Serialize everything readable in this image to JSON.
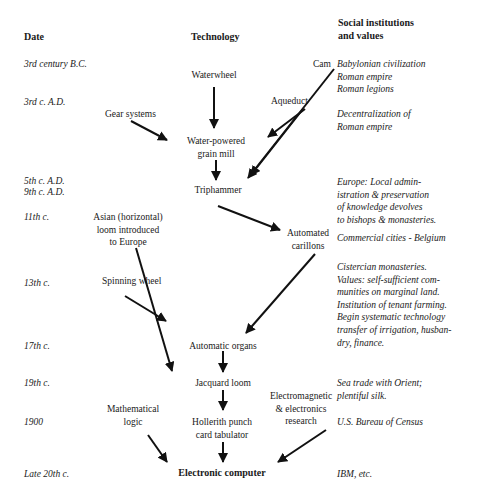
{
  "headers": {
    "date": "Date",
    "technology": "Technology",
    "social": [
      "Social institutions",
      "and values"
    ]
  },
  "dates": [
    "3rd century B.C.",
    "3rd c. A.D.",
    "5th c. A.D.",
    "9th c. A.D.",
    "11th c.",
    "13th c.",
    "17th c.",
    "19th c.",
    "1900",
    "Late 20th c."
  ],
  "technologies": {
    "waterwheel": "Waterwheel",
    "cam": "Cam",
    "gear_systems": "Gear systems",
    "aqueduct": "Aqueduct",
    "grain_mill": [
      "Water-powered",
      "grain mill"
    ],
    "triphammer": "Triphammer",
    "asian_loom": [
      "Asian (horizontal)",
      "loom introduced",
      "to Europe"
    ],
    "carillons": [
      "Automated",
      "carillons"
    ],
    "spinning_wheel": "Spinning wheel",
    "organs": "Automatic organs",
    "jacquard": "Jacquard loom",
    "math_logic": [
      "Mathematical",
      "logic"
    ],
    "hollerith": [
      "Hollerith punch",
      "card tabulator"
    ],
    "electromagnetic": [
      "Electromagnetic",
      "& electronics",
      "research"
    ],
    "computer": "Electronic computer"
  },
  "social": {
    "babylon": [
      "Babylonian civilization",
      "Roman empire",
      "Roman legions"
    ],
    "decentral": [
      "Decentralization of",
      "Roman empire"
    ],
    "europe": [
      "Europe: Local admin-",
      "istration & preservation",
      "of knowledge devolves",
      "to bishops & monasteries."
    ],
    "commercial": "Commercial cities - Belgium",
    "cistercian": [
      "Cistercian monasteries.",
      "Values: self-sufficient com-",
      "munities on marginal land.",
      "Institution of tenant farming.",
      "Begin systematic technology",
      "transfer of irrigation, husban-",
      "dry, finance."
    ],
    "seatrade": [
      "Sea trade with Orient;",
      "plentiful silk."
    ],
    "census": "U.S. Bureau of Census",
    "ibm": "IBM, etc."
  }
}
